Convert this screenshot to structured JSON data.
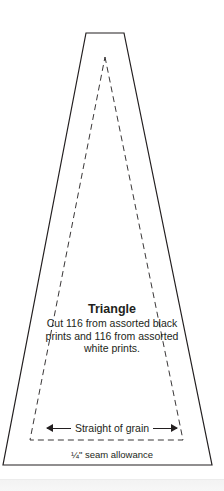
{
  "template": {
    "title": "Triangle",
    "instructions": "Cut 116 from assorted black prints and 116 from assorted white prints.",
    "grain_label": "Straight of grain",
    "seam_label": "¼\" seam allowance",
    "colors": {
      "line": "#231f20",
      "background": "#ffffff"
    }
  }
}
